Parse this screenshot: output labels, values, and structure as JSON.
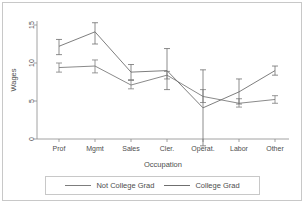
{
  "chart_data": {
    "type": "line",
    "title": "",
    "xlabel": "Occupation",
    "ylabel": "Wages",
    "categories": [
      "Prof",
      "Mgmt",
      "Sales",
      "Cler.",
      "Operat.",
      "Labor",
      "Other"
    ],
    "ylim": [
      0,
      16
    ],
    "yticks": [
      0,
      5,
      10,
      15
    ],
    "ytick_labels": [
      "0",
      "5",
      "10",
      "15"
    ],
    "grid": false,
    "legend_position": "bottom",
    "error_bars": "95% CI",
    "series": [
      {
        "name": "Not College Grad",
        "color": "#7d7d7d",
        "values": [
          9.4,
          9.6,
          7.1,
          8.4,
          5.6,
          4.7,
          5.2
        ],
        "err_low": [
          8.8,
          8.7,
          6.6,
          7.9,
          4.8,
          4.2,
          4.7
        ],
        "err_high": [
          10.0,
          10.4,
          7.7,
          8.9,
          6.5,
          5.3,
          5.7
        ]
      },
      {
        "name": "College Grad",
        "color": "#6f6f6f",
        "values": [
          12.2,
          14.1,
          8.8,
          9.0,
          4.1,
          6.2,
          9.0
        ],
        "err_low": [
          11.1,
          12.5,
          7.8,
          6.5,
          -0.9,
          4.6,
          8.4
        ],
        "err_high": [
          13.1,
          15.3,
          9.8,
          11.9,
          9.1,
          7.9,
          9.6
        ]
      }
    ]
  },
  "legend": {
    "items": [
      {
        "label": "Not College Grad"
      },
      {
        "label": "College Grad"
      }
    ]
  },
  "axes": {
    "y_title": "Wages",
    "x_title": "Occupation"
  }
}
